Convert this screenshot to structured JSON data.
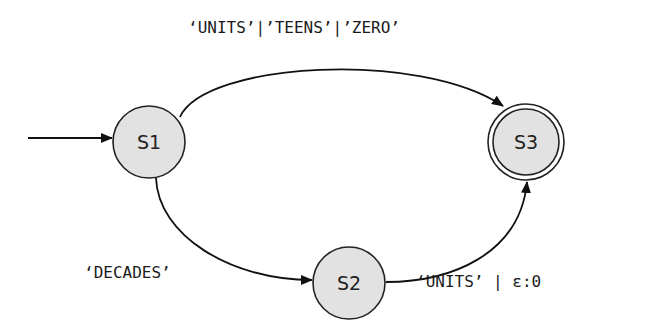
{
  "diagram": {
    "type": "finite-state-automaton",
    "states": [
      {
        "id": "S1",
        "label": "S1",
        "initial": true,
        "accepting": false
      },
      {
        "id": "S2",
        "label": "S2",
        "initial": false,
        "accepting": false
      },
      {
        "id": "S3",
        "label": "S3",
        "initial": false,
        "accepting": true
      }
    ],
    "transitions": [
      {
        "from": "S1",
        "to": "S3",
        "label": "‘UNITS’|’TEENS’|’ZERO’"
      },
      {
        "from": "S1",
        "to": "S2",
        "label": "‘DECADES’"
      },
      {
        "from": "S2",
        "to": "S3",
        "label": "‘UNITS’ | ε:0"
      }
    ],
    "colors": {
      "state_fill": "#e2e2e2",
      "stroke": "#222222",
      "background": "#ffffff"
    }
  }
}
